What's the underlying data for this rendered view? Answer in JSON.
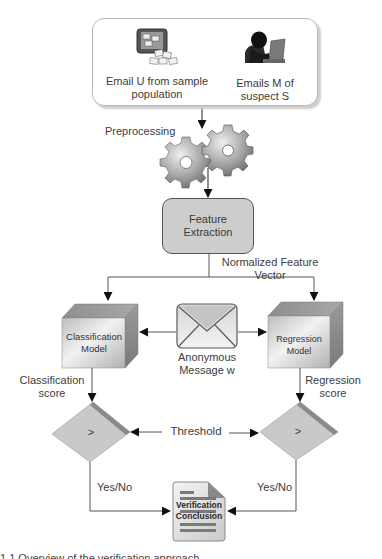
{
  "diagram": {
    "source_box": {
      "items": [
        {
          "icon": "computer-with-emails-icon",
          "label_line1": "Email U from sample",
          "label_line2": "population"
        },
        {
          "icon": "hooded-suspect-laptop-icon",
          "label_line1": "Emails M of",
          "label_line2": "suspect S"
        }
      ]
    },
    "preprocessing": {
      "label": "Preprocessing",
      "icon": "gears-icon"
    },
    "feature_extraction": {
      "label_line1": "Feature",
      "label_line2": "Extraction"
    },
    "feature_vector": {
      "label_line1": "Normalized Feature",
      "label_line2": "Vector"
    },
    "classification_model": {
      "label_line1": "Classification",
      "label_line2": "Model"
    },
    "regression_model": {
      "label_line1": "Regression",
      "label_line2": "Model"
    },
    "anonymous_message": {
      "icon": "envelope-icon",
      "label_line1": "Anonymous",
      "label_line2": "Message w"
    },
    "classification_score": {
      "label_line1": "Classification",
      "label_line2": "score"
    },
    "regression_score": {
      "label_line1": "Regression",
      "label_line2": "score"
    },
    "threshold": {
      "label": "Threshold"
    },
    "left_comparator": {
      "symbol": ">"
    },
    "right_comparator": {
      "symbol": ">"
    },
    "left_output": {
      "label": "Yes/No"
    },
    "right_output": {
      "label": "Yes/No"
    },
    "conclusion": {
      "icon": "document-icon",
      "label_line1": "Verification",
      "label_line2": "Conclusion"
    },
    "caption": "1.1  Overview of the verification approach"
  },
  "colors": {
    "node_fill": "#cdcdcd",
    "diamond_fill": "#c8c8c8",
    "diamond_edge": "#8a8a8a",
    "line": "#555555",
    "arrow": "#111111"
  }
}
